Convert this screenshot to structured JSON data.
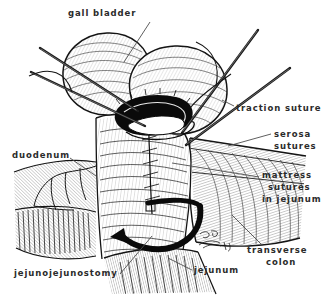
{
  "figure": {
    "background_color": "#ffffff",
    "ink_color": "#1a1a1a",
    "label_color": "#2b2b2b",
    "width": 328,
    "height": 298
  },
  "labels": [
    {
      "id": "gall-bladder",
      "text": "gall bladder",
      "x": 68,
      "y": 8,
      "align": "left"
    },
    {
      "id": "traction-suture",
      "text": "traction suture",
      "x": 236,
      "y": 103,
      "align": "left"
    },
    {
      "id": "serosa",
      "text": "serosa",
      "x": 274,
      "y": 129,
      "align": "left"
    },
    {
      "id": "serosa-sutures",
      "text": "sutures",
      "x": 274,
      "y": 141,
      "align": "left"
    },
    {
      "id": "duodenum",
      "text": "duodenum",
      "x": 12,
      "y": 150,
      "align": "left"
    },
    {
      "id": "mattress",
      "text": "mattress",
      "x": 262,
      "y": 170,
      "align": "left"
    },
    {
      "id": "mattress-sutures",
      "text": "sutures",
      "x": 268,
      "y": 182,
      "align": "left"
    },
    {
      "id": "in-jejunum",
      "text": "in jejunum",
      "x": 262,
      "y": 194,
      "align": "left"
    },
    {
      "id": "transverse",
      "text": "transverse",
      "x": 247,
      "y": 245,
      "align": "left"
    },
    {
      "id": "colon",
      "text": "colon",
      "x": 266,
      "y": 257,
      "align": "left"
    },
    {
      "id": "jejunum",
      "text": "jejunum",
      "x": 194,
      "y": 265,
      "align": "left"
    },
    {
      "id": "jejunojejunostomy",
      "text": "jejunojejunostomy",
      "x": 14,
      "y": 268,
      "align": "left"
    }
  ],
  "annotations": {
    "signature": "artist signature",
    "arrow": "curved rotation arrow indicating bowel limb direction",
    "needles": 4,
    "needle_description": "straight suture needles entering from upper-left and upper-right"
  }
}
